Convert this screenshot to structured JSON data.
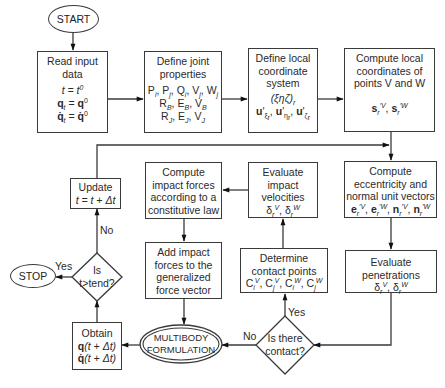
{
  "diagram": {
    "type": "flowchart",
    "start": {
      "label": "START"
    },
    "stop": {
      "label": "STOP"
    },
    "read_input": {
      "title": "Read input\ndata",
      "lines": [
        "t = t⁰",
        "q_t = q⁰",
        "q̇_t = q̇⁰"
      ]
    },
    "define_joint": {
      "title": "Define joint\nproperties",
      "lines": [
        "P_i, P_j, Q_i, V_j, W_j",
        "R_B, E_B, V_B",
        "R_J, E_J, V_J"
      ]
    },
    "define_local": {
      "title": "Define local\ncoordinate\nsystem",
      "lines": [
        "(ξηζ)_r",
        "u'_ξr, u'_ηr, u'_ζr"
      ]
    },
    "compute_local": {
      "title": "Compute local\ncoordinates of\npoints V and W",
      "lines": [
        "s'^V_r, s'^W_r"
      ]
    },
    "update": {
      "title": "Update",
      "lines": [
        "t = t + Δt"
      ]
    },
    "compute_impact": {
      "title": "Compute\nimpact forces\naccording to a\nconstitutive law"
    },
    "evaluate_velocities": {
      "title": "Evaluate\nimpact\nvelocities",
      "lines": [
        "δ_r^V, δ_r^W"
      ]
    },
    "compute_eccentricity": {
      "title": "Compute\neccentricity and\nnormal unit vectors",
      "lines": [
        "e'^V_r, e'^W_r, n'^V_r, n'^W_r"
      ]
    },
    "decision_tend": {
      "label": "Is\nt>tend?",
      "yes": "Yes",
      "no": "No"
    },
    "add_impact": {
      "title": "Add impact\nforces to the\ngeneralized\nforce vector"
    },
    "determine_contact": {
      "title": "Determine\ncontact points",
      "lines": [
        "C_i^V, C_j^V, C_i^W, C_j^W"
      ]
    },
    "evaluate_penetrations": {
      "title": "Evaluate\npenetrations",
      "lines": [
        "δ_r^V, δ_r^W"
      ]
    },
    "obtain": {
      "title": "Obtain",
      "lines": [
        "q(t + Δt)",
        "q̇(t + Δt)"
      ]
    },
    "multibody": {
      "label": "MULTIBODY\nFORMULATION"
    },
    "decision_contact": {
      "label": "Is there\ncontact?",
      "yes": "Yes",
      "no": "No"
    }
  }
}
